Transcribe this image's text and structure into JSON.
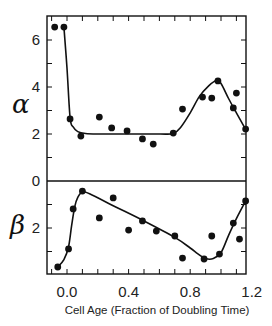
{
  "chart_data": {
    "type": "scatter",
    "title": "",
    "xlabel": "Cell Age (Fraction of Doubling Time)",
    "xlim": [
      -0.13,
      1.17
    ],
    "x_ticks": [
      0.0,
      0.4,
      0.8,
      1.2
    ],
    "x_tick_labels": [
      "0.0",
      "0.4",
      "0.8",
      "1.2"
    ],
    "grid": false,
    "panels": [
      {
        "name": "alpha",
        "ylabel": "α",
        "ylim": [
          0,
          7
        ],
        "y_tick_labels": [
          "6",
          "4",
          "2",
          "0"
        ],
        "y_ticks": [
          6,
          4,
          2,
          0
        ],
        "direction": "up",
        "points": [
          [
            -0.08,
            6.55
          ],
          [
            -0.02,
            6.55
          ],
          [
            0.02,
            2.64
          ],
          [
            0.09,
            1.91
          ],
          [
            0.21,
            2.72
          ],
          [
            0.29,
            2.26
          ],
          [
            0.39,
            2.13
          ],
          [
            0.49,
            1.79
          ],
          [
            0.56,
            1.57
          ],
          [
            0.69,
            2.04
          ],
          [
            0.75,
            3.06
          ],
          [
            0.88,
            3.57
          ],
          [
            0.94,
            3.53
          ],
          [
            0.98,
            4.26
          ],
          [
            1.08,
            3.11
          ],
          [
            1.1,
            3.74
          ],
          [
            1.16,
            2.21
          ]
        ],
        "fit_curve": [
          [
            -0.02,
            6.55
          ],
          [
            0.0,
            4.8
          ],
          [
            0.02,
            2.7
          ],
          [
            0.04,
            2.3
          ],
          [
            0.07,
            2.1
          ],
          [
            0.12,
            2.02
          ],
          [
            0.2,
            2.0
          ],
          [
            0.4,
            2.0
          ],
          [
            0.6,
            2.0
          ],
          [
            0.69,
            2.02
          ],
          [
            0.74,
            2.3
          ],
          [
            0.8,
            2.9
          ],
          [
            0.86,
            3.6
          ],
          [
            0.92,
            4.05
          ],
          [
            0.97,
            4.28
          ],
          [
            1.0,
            4.15
          ],
          [
            1.05,
            3.5
          ],
          [
            1.1,
            2.9
          ],
          [
            1.16,
            2.2
          ]
        ]
      },
      {
        "name": "beta",
        "ylabel": "β",
        "ylim": [
          0,
          4
        ],
        "y_tick_labels": [
          "2"
        ],
        "y_ticks": [
          2
        ],
        "direction": "down",
        "points": [
          [
            -0.06,
            3.66
          ],
          [
            0.01,
            2.89
          ],
          [
            0.04,
            1.19
          ],
          [
            0.1,
            0.43
          ],
          [
            0.21,
            1.57
          ],
          [
            0.3,
            0.72
          ],
          [
            0.4,
            2.09
          ],
          [
            0.49,
            1.7
          ],
          [
            0.58,
            2.13
          ],
          [
            0.7,
            2.34
          ],
          [
            0.75,
            3.28
          ],
          [
            0.89,
            3.32
          ],
          [
            0.94,
            2.34
          ],
          [
            0.99,
            3.11
          ],
          [
            1.08,
            1.79
          ],
          [
            1.12,
            2.47
          ],
          [
            1.16,
            0.85
          ]
        ],
        "fit_curve": [
          [
            -0.06,
            3.66
          ],
          [
            -0.02,
            3.35
          ],
          [
            0.01,
            2.8
          ],
          [
            0.03,
            1.9
          ],
          [
            0.05,
            1.1
          ],
          [
            0.07,
            0.7
          ],
          [
            0.1,
            0.47
          ],
          [
            0.15,
            0.55
          ],
          [
            0.3,
            1.05
          ],
          [
            0.5,
            1.7
          ],
          [
            0.7,
            2.4
          ],
          [
            0.8,
            2.85
          ],
          [
            0.85,
            3.1
          ],
          [
            0.9,
            3.3
          ],
          [
            0.95,
            3.3
          ],
          [
            1.0,
            3.05
          ],
          [
            1.05,
            2.3
          ],
          [
            1.1,
            1.6
          ],
          [
            1.16,
            0.85
          ]
        ]
      }
    ]
  }
}
